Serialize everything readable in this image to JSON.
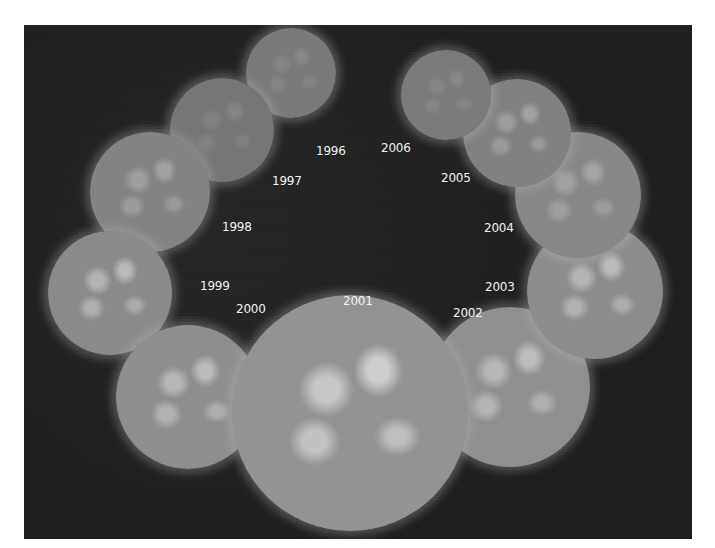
{
  "figure": {
    "background_color": "#1f1f1f",
    "suns": [
      {
        "year": "1996",
        "cx": 267,
        "cy": 48,
        "r": 45,
        "activity": "low",
        "fill": "#7a7a7a"
      },
      {
        "year": "1997",
        "cx": 198,
        "cy": 105,
        "r": 52,
        "activity": "low",
        "fill": "#767676"
      },
      {
        "year": "1998",
        "cx": 126,
        "cy": 167,
        "r": 60,
        "activity": "moderate",
        "fill": "#838383"
      },
      {
        "year": "1999",
        "cx": 86,
        "cy": 268,
        "r": 62,
        "activity": "high",
        "fill": "#8a8a8a"
      },
      {
        "year": "2000",
        "cx": 164,
        "cy": 372,
        "r": 72,
        "activity": "high",
        "fill": "#8e8e8e"
      },
      {
        "year": "2001",
        "cx": 326,
        "cy": 388,
        "r": 118,
        "activity": "maximum",
        "fill": "#939393"
      },
      {
        "year": "2002",
        "cx": 486,
        "cy": 362,
        "r": 80,
        "activity": "high",
        "fill": "#8f8f8f"
      },
      {
        "year": "2003",
        "cx": 571,
        "cy": 266,
        "r": 68,
        "activity": "high",
        "fill": "#8c8c8c"
      },
      {
        "year": "2004",
        "cx": 554,
        "cy": 170,
        "r": 63,
        "activity": "moderate",
        "fill": "#878787"
      },
      {
        "year": "2005",
        "cx": 493,
        "cy": 108,
        "r": 54,
        "activity": "moderate",
        "fill": "#818181"
      },
      {
        "year": "2006",
        "cx": 422,
        "cy": 70,
        "r": 45,
        "activity": "low",
        "fill": "#7b7b7b"
      }
    ],
    "labels": [
      {
        "text": "1996",
        "x": 292,
        "y": 120
      },
      {
        "text": "1997",
        "x": 248,
        "y": 150
      },
      {
        "text": "1998",
        "x": 198,
        "y": 196
      },
      {
        "text": "1999",
        "x": 176,
        "y": 255
      },
      {
        "text": "2000",
        "x": 212,
        "y": 278
      },
      {
        "text": "2001",
        "x": 319,
        "y": 270
      },
      {
        "text": "2002",
        "x": 429,
        "y": 282
      },
      {
        "text": "2003",
        "x": 461,
        "y": 256
      },
      {
        "text": "2004",
        "x": 460,
        "y": 197
      },
      {
        "text": "2005",
        "x": 417,
        "y": 147
      },
      {
        "text": "2006",
        "x": 357,
        "y": 117
      }
    ]
  }
}
